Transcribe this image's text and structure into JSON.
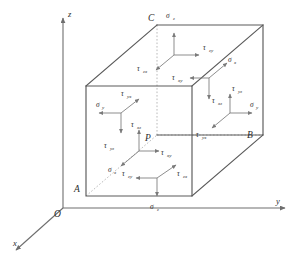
{
  "figure": {
    "kind": "stress-cube-diagram",
    "background_color": "#ffffff",
    "edge_color": "#5a5a5a",
    "hidden_edge_color": "#a8a8a8",
    "arrow_color": "#7a7a7a",
    "axis_color": "#6e6e6e",
    "text_color": "#2b2b2b"
  },
  "axes": {
    "origin_label": "O",
    "items": [
      {
        "name": "z-axis",
        "label": "z",
        "direction": "up"
      },
      {
        "name": "y-axis",
        "label": "y",
        "direction": "right"
      },
      {
        "name": "x-axis",
        "label": "x",
        "direction": "down-left"
      }
    ]
  },
  "points": [
    {
      "name": "point-P",
      "label": "P"
    },
    {
      "name": "point-A",
      "label": "A"
    },
    {
      "name": "point-B",
      "label": "B"
    },
    {
      "name": "point-C",
      "label": "C"
    }
  ],
  "faces": {
    "top": {
      "name": "top-face",
      "normal": "z",
      "stresses": [
        {
          "symbol": "σ",
          "sub": "z",
          "kind": "normal",
          "dir": "up"
        },
        {
          "symbol": "τ",
          "sub": "zy",
          "kind": "shear",
          "dir": "right"
        },
        {
          "symbol": "τ",
          "sub": "zx",
          "kind": "shear",
          "dir": "down-left"
        }
      ]
    },
    "bottom": {
      "name": "bottom-face",
      "normal": "z",
      "stresses": [
        {
          "symbol": "σ",
          "sub": "z",
          "kind": "normal",
          "dir": "down"
        },
        {
          "symbol": "τ",
          "sub": "zy",
          "kind": "shear",
          "dir": "left"
        },
        {
          "symbol": "τ",
          "sub": "zx",
          "kind": "shear",
          "dir": "up-right"
        }
      ]
    },
    "front_left": {
      "name": "front-left-face",
      "normal": "y",
      "stresses": [
        {
          "symbol": "σ",
          "sub": "y",
          "kind": "normal",
          "dir": "left"
        },
        {
          "symbol": "τ",
          "sub": "yx",
          "kind": "shear",
          "dir": "up-right"
        },
        {
          "symbol": "τ",
          "sub": "yz",
          "kind": "shear",
          "dir": "down"
        }
      ]
    },
    "back_right": {
      "name": "back-right-face",
      "normal": "y",
      "stresses": [
        {
          "symbol": "σ",
          "sub": "y",
          "kind": "normal",
          "dir": "right"
        },
        {
          "symbol": "τ",
          "sub": "yz",
          "kind": "shear",
          "dir": "up"
        },
        {
          "symbol": "τ",
          "sub": "yx",
          "kind": "shear",
          "dir": "down-left"
        }
      ]
    },
    "near_x": {
      "name": "near-x-face",
      "normal": "x",
      "stresses": [
        {
          "symbol": "σ",
          "sub": "x",
          "kind": "normal",
          "dir": "down-left"
        },
        {
          "symbol": "τ",
          "sub": "xz",
          "kind": "shear",
          "dir": "up"
        },
        {
          "symbol": "τ",
          "sub": "xy",
          "kind": "shear",
          "dir": "right"
        }
      ]
    },
    "far_x": {
      "name": "far-x-face",
      "normal": "x",
      "stresses": [
        {
          "symbol": "σ",
          "sub": "x",
          "kind": "normal",
          "dir": "up-right"
        },
        {
          "symbol": "τ",
          "sub": "xz",
          "kind": "shear",
          "dir": "down"
        },
        {
          "symbol": "τ",
          "sub": "xy",
          "kind": "shear",
          "dir": "left"
        }
      ]
    }
  },
  "labels": {
    "sigma": "σ",
    "tau": "τ",
    "sub_z": "z",
    "sub_y": "y",
    "sub_x": "x",
    "sub_zy": "zy",
    "sub_zx": "zx",
    "sub_yx": "yx",
    "sub_yz": "yz",
    "sub_xz": "xz",
    "sub_xy": "xy"
  }
}
